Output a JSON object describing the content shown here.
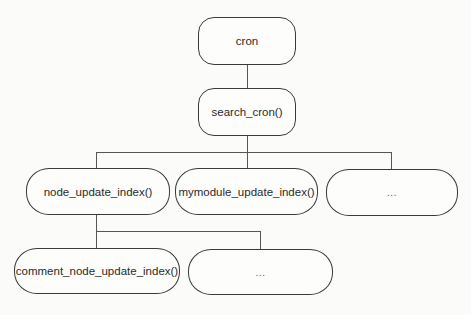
{
  "diagram": {
    "type": "call-tree",
    "nodes": [
      {
        "id": "cron",
        "label": "cron",
        "level": 0
      },
      {
        "id": "search_cron",
        "label": "search_cron()",
        "level": 1,
        "parent": "cron"
      },
      {
        "id": "node_update_index",
        "label": "node_update_index()",
        "level": 2,
        "parent": "search_cron"
      },
      {
        "id": "mymodule_update_index",
        "label": "mymodule_update_index()",
        "level": 2,
        "parent": "search_cron"
      },
      {
        "id": "level2_more",
        "label": "...",
        "level": 2,
        "parent": "search_cron"
      },
      {
        "id": "comment_node_update_index",
        "label": "comment_node_update_index()",
        "level": 3,
        "parent": "node_update_index"
      },
      {
        "id": "level3_more",
        "label": "...",
        "level": 3,
        "parent": "node_update_index"
      }
    ],
    "colors": {
      "stroke": "#3a3a3a",
      "background": "#fbfbf9",
      "text": "#2a2a2a"
    }
  }
}
